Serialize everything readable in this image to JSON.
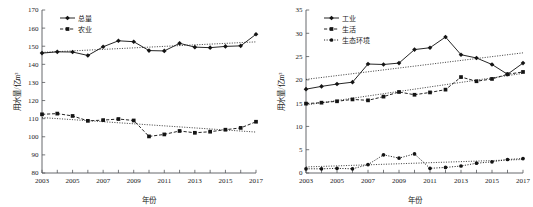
{
  "figure": {
    "name": "water-use-two-panel-figure",
    "panels": [
      "left",
      "right"
    ]
  },
  "chart_data": [
    {
      "type": "line",
      "panel": "left",
      "title": "",
      "xlabel": "年份",
      "ylabel": "用水量/亿m³",
      "xlim": [
        2003,
        2017
      ],
      "ylim": [
        80,
        170
      ],
      "yticks": [
        80,
        90,
        100,
        110,
        120,
        130,
        140,
        150,
        160,
        170
      ],
      "xticks": [
        2003,
        2005,
        2007,
        2009,
        2011,
        2013,
        2015,
        2017
      ],
      "xticks_minor": [
        2004,
        2006,
        2008,
        2010,
        2012,
        2014,
        2016
      ],
      "grid": false,
      "legend_position": "top-left",
      "x": [
        2003,
        2004,
        2005,
        2006,
        2007,
        2008,
        2009,
        2010,
        2011,
        2012,
        2013,
        2014,
        2015,
        2016,
        2017
      ],
      "series": [
        {
          "name": "总量",
          "style": "solid",
          "marker": "diamond",
          "values": [
            146.2,
            146.9,
            146.8,
            144.9,
            149.7,
            153.0,
            152.5,
            147.6,
            147.4,
            151.6,
            149.5,
            149.2,
            149.9,
            150.2,
            156.6
          ]
        },
        {
          "name": "农业",
          "style": "dashed",
          "marker": "square",
          "values": [
            112.4,
            112.8,
            111.5,
            108.8,
            109.2,
            109.8,
            109.0,
            100.2,
            101.3,
            103.2,
            102.2,
            102.8,
            103.9,
            104.9,
            108.3
          ]
        }
      ],
      "trendlines": [
        {
          "for": "总量",
          "start": [
            2003,
            146.6
          ],
          "end": [
            2017,
            152.4
          ]
        },
        {
          "for": "农业",
          "start": [
            2003,
            110.6
          ],
          "end": [
            2017,
            102.6
          ]
        }
      ]
    },
    {
      "type": "line",
      "panel": "right",
      "title": "",
      "xlabel": "年份",
      "ylabel": "用水量/亿m³",
      "xlim": [
        2003,
        2017
      ],
      "ylim": [
        0,
        35
      ],
      "yticks": [
        0,
        5,
        10,
        15,
        20,
        25,
        30,
        35
      ],
      "xticks": [
        2003,
        2005,
        2007,
        2009,
        2011,
        2013,
        2015,
        2017
      ],
      "xticks_minor": [
        2004,
        2006,
        2008,
        2010,
        2012,
        2014,
        2016
      ],
      "grid": false,
      "legend_position": "top-left",
      "x": [
        2003,
        2004,
        2005,
        2006,
        2007,
        2008,
        2009,
        2010,
        2011,
        2012,
        2013,
        2014,
        2015,
        2016,
        2017
      ],
      "series": [
        {
          "name": "工业",
          "style": "solid",
          "marker": "diamond",
          "values": [
            18.0,
            18.6,
            19.1,
            19.5,
            23.4,
            23.3,
            23.6,
            26.5,
            26.9,
            29.2,
            25.4,
            24.7,
            23.3,
            21.2,
            23.6
          ]
        },
        {
          "name": "生活",
          "style": "dashed",
          "marker": "square",
          "values": [
            14.9,
            15.1,
            15.4,
            15.8,
            15.6,
            16.4,
            17.4,
            16.8,
            17.3,
            17.9,
            20.6,
            19.7,
            20.2,
            21.2,
            21.7
          ]
        },
        {
          "name": "生态环境",
          "style": "dotted",
          "marker": "circle",
          "values": [
            0.9,
            0.9,
            1.0,
            0.9,
            1.8,
            3.9,
            3.2,
            4.1,
            1.0,
            1.2,
            1.5,
            2.1,
            2.4,
            2.9,
            3.1
          ]
        }
      ],
      "trendlines": [
        {
          "for": "工业",
          "start": [
            2003,
            20.1
          ],
          "end": [
            2017,
            25.8
          ]
        },
        {
          "for": "生活",
          "start": [
            2003,
            14.6
          ],
          "end": [
            2017,
            21.4
          ]
        },
        {
          "for": "生态环境",
          "start": [
            2003,
            1.3
          ],
          "end": [
            2017,
            2.9
          ]
        }
      ]
    }
  ]
}
